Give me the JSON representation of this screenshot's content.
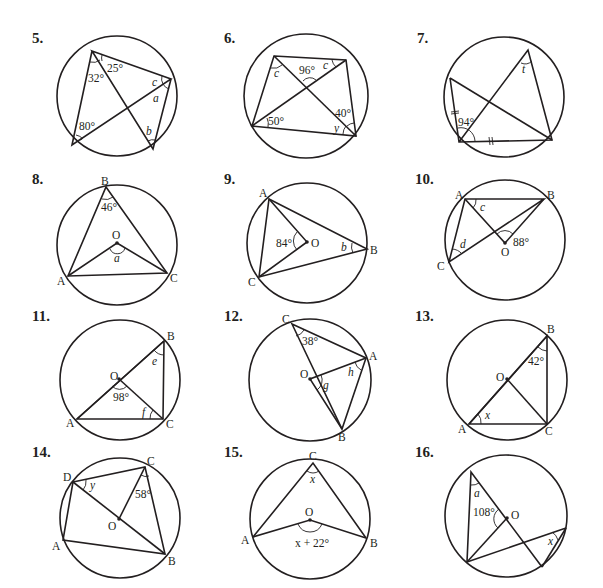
{
  "problems": [
    {
      "number": "5.",
      "labels": {
        "angle1": "32°",
        "angle2": "25°",
        "angle3": "80°",
        "var_a": "a",
        "var_b": "b",
        "var_c": "c"
      }
    },
    {
      "number": "6.",
      "labels": {
        "angle1": "96°",
        "angle2": "50°",
        "angle3": "40°",
        "var_c1": "c",
        "var_c2": "c",
        "var_y": "y"
      }
    },
    {
      "number": "7.",
      "labels": {
        "angle1": "94°",
        "var_t": "t"
      }
    },
    {
      "number": "8.",
      "labels": {
        "B": "B",
        "O": "O",
        "A": "A",
        "C": "C",
        "angle1": "46°",
        "var_a": "a"
      }
    },
    {
      "number": "9.",
      "labels": {
        "A": "A",
        "O": "O",
        "B": "B",
        "C": "C",
        "angle1": "84°",
        "var_b": "b"
      }
    },
    {
      "number": "10.",
      "labels": {
        "A": "A",
        "B": "B",
        "O": "O",
        "C": "C",
        "angle1": "88°",
        "var_c": "c",
        "var_d": "d"
      }
    },
    {
      "number": "11.",
      "labels": {
        "B": "B",
        "O": "O",
        "A": "A",
        "C": "C",
        "angle1": "98°",
        "var_e": "e",
        "var_f": "f"
      }
    },
    {
      "number": "12.",
      "labels": {
        "C": "C",
        "A": "A",
        "O": "O",
        "B": "B",
        "angle1": "38°",
        "var_g": "g",
        "var_h": "h"
      }
    },
    {
      "number": "13.",
      "labels": {
        "B": "B",
        "O": "O",
        "A": "A",
        "C": "C",
        "angle1": "42°",
        "var_x": "x"
      }
    },
    {
      "number": "14.",
      "labels": {
        "D": "D",
        "C": "C",
        "O": "O",
        "A": "A",
        "B": "B",
        "angle1": "58°",
        "var_y": "y"
      }
    },
    {
      "number": "15.",
      "labels": {
        "C": "C",
        "O": "O",
        "A": "A",
        "B": "B",
        "var_x": "x",
        "expr": "x + 22°"
      }
    },
    {
      "number": "16.",
      "labels": {
        "O": "O",
        "angle1": "108°",
        "var_a": "a",
        "var_x": "x"
      }
    }
  ]
}
